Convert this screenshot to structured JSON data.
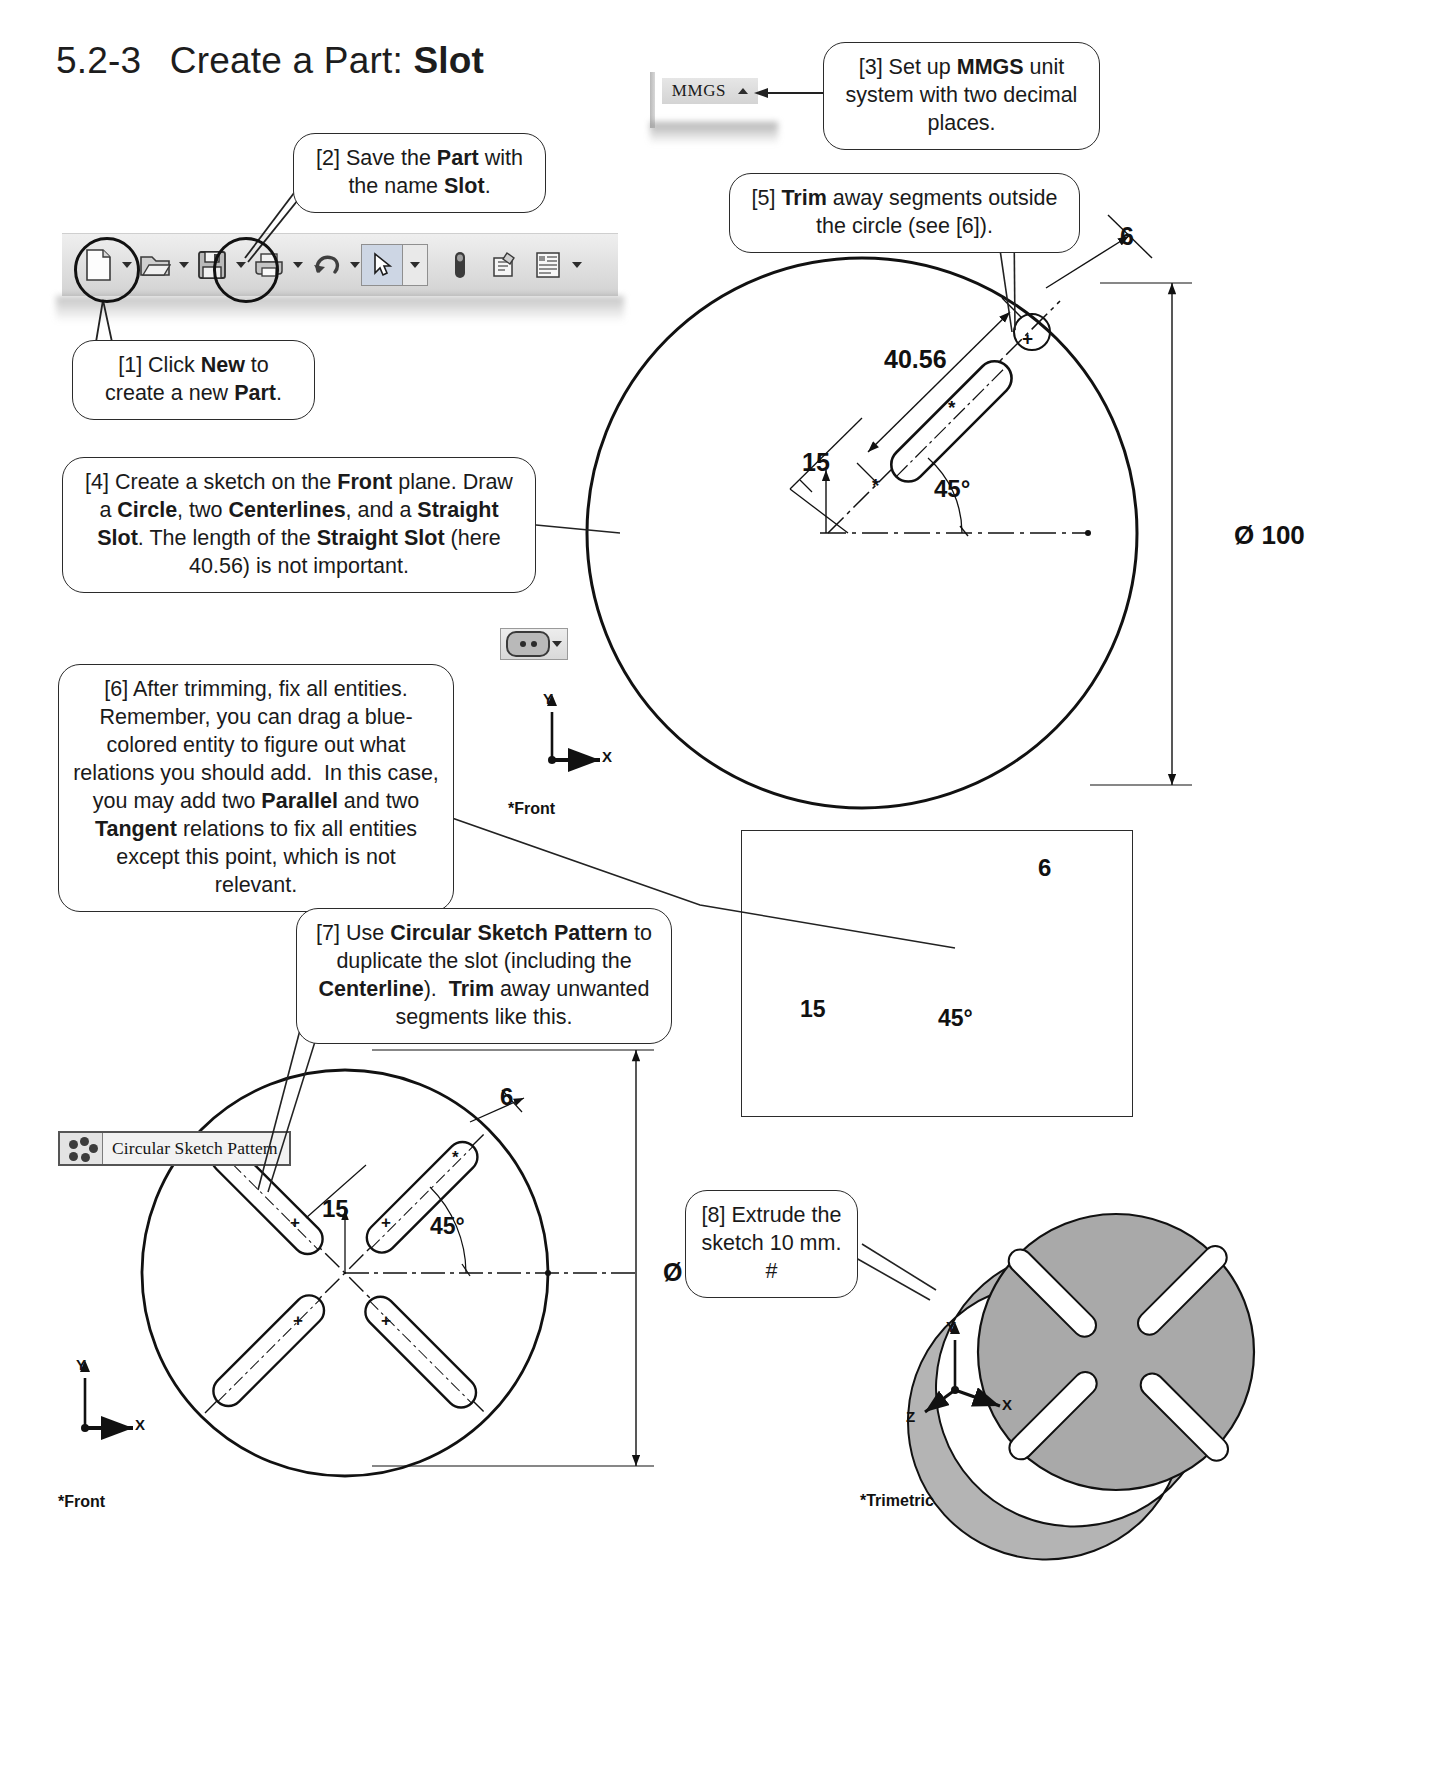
{
  "title": {
    "number": "5.2-3",
    "text": "Create a Part:",
    "bold": "Slot"
  },
  "callouts": [
    {
      "id": "1",
      "text_html": "[1] Click <b>New</b> to create a new <b>Part</b>."
    },
    {
      "id": "2",
      "text_html": "[2] Save the <b>Part</b> with the name <b>Slot</b>."
    },
    {
      "id": "3",
      "text_html": "[3] Set up <b>MMGS</b> unit system with two decimal places."
    },
    {
      "id": "4",
      "text_html": "[4] Create a sketch on the <b>Front</b> plane. Draw a <b>Circle</b>, two <b>Centerlines</b>, and a <b>Straight Slot</b>. The length of the <b>Straight Slot</b> (here 40.56) is not important."
    },
    {
      "id": "5",
      "text_html": "[5] <b>Trim</b> away segments outside the circle (see [6])."
    },
    {
      "id": "6",
      "text_html": "[6] After trimming, fix all entities. Remember, you can drag a blue-colored entity to figure out what relations you should add.&nbsp; In this case, you may add two <b>Parallel</b> and two <b>Tangent</b> relations to fix all entities except this point, which is not relevant."
    },
    {
      "id": "7",
      "text_html": "[7] Use <b>Circular Sketch Pattern</b> to duplicate the slot (including the <b>Centerline</b>).&nbsp; <b>Trim</b> away unwanted segments like this."
    },
    {
      "id": "8",
      "text_html": "[8] Extrude the sketch 10 mm. #"
    }
  ],
  "toolbar": {
    "icons": [
      {
        "name": "new-document-icon",
        "caret": true
      },
      {
        "name": "open-folder-icon",
        "caret": true
      },
      {
        "name": "save-disk-icon",
        "caret": true
      },
      {
        "name": "print-icon",
        "caret": true
      },
      {
        "name": "undo-icon",
        "caret": true
      },
      {
        "name": "select-pointer-icon",
        "caret": true
      },
      {
        "name": "rebuild-icon",
        "caret": false
      },
      {
        "name": "options-icon",
        "caret": false
      },
      {
        "name": "list-properties-icon",
        "caret": true
      }
    ]
  },
  "unit_widget": {
    "label": "MMGS",
    "caret": "up"
  },
  "fix_entities_button": {
    "name": "fix-entities-button"
  },
  "circular_pattern_button": {
    "label": "Circular Sketch Pattern"
  },
  "drawing_main": {
    "diameter": "Ø 100",
    "slot_length": "40.56",
    "slot_width": "6",
    "offset": "15",
    "angle": "45°",
    "axis_x": "X",
    "axis_y": "Y",
    "view_label": "*Front"
  },
  "drawing_inset": {
    "slot_width": "6",
    "offset": "15",
    "angle": "45°"
  },
  "drawing_pattern": {
    "diameter": "Ø 100",
    "slot_width": "6",
    "offset": "15",
    "angle": "45°",
    "axis_x": "X",
    "axis_y": "Y",
    "view_label": "*Front"
  },
  "drawing_3d": {
    "axis_x": "X",
    "axis_y": "Y",
    "axis_z": "Z",
    "view_label": "*Trimetric"
  },
  "colors": {
    "line": "#1a1a1a",
    "part_fill": "#a8a8a8",
    "toolbar_bg": "#e2e2e2"
  }
}
